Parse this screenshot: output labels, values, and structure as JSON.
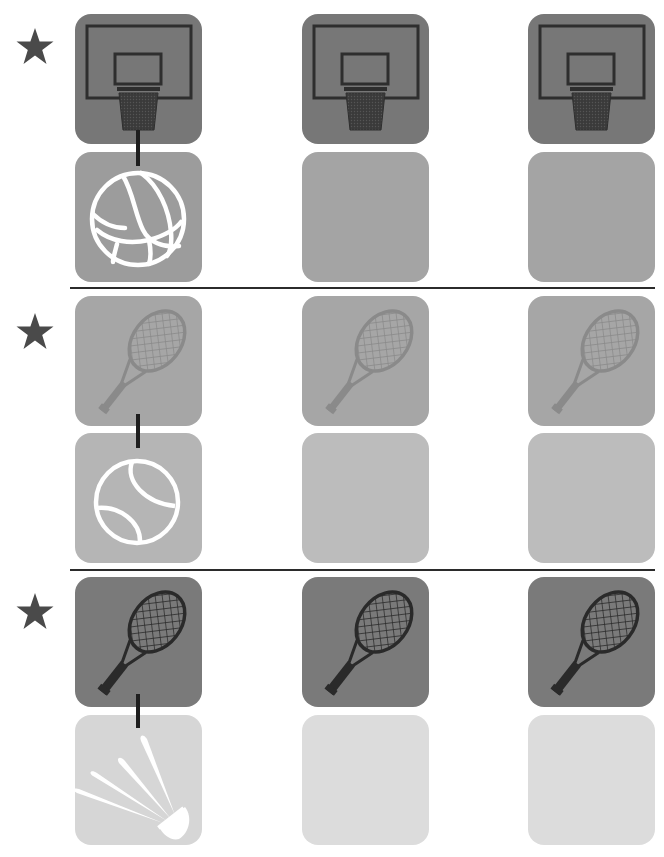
{
  "worksheet": {
    "type": "matching-activity",
    "columns": 3,
    "colors": {
      "star": "#4a4a4a",
      "connector": "#1e1e1e",
      "divider": "#2b2b2b",
      "glyph_white": "#ffffff"
    },
    "sections": [
      {
        "id": "basketball",
        "top": 14,
        "star_top": 27,
        "connector_top": 130,
        "connector_height": 36,
        "top_tile": {
          "icon": "basketball-hoop-icon",
          "bg": "#777777",
          "glyph": "#2e2e2e"
        },
        "bottom_tile": {
          "icon": "basketball-icon",
          "bg": "#9c9c9c"
        },
        "bottom_top": 152,
        "blank_bg": "#a4a4a4",
        "example_pair": [
          "basketball-hoop",
          "basketball"
        ]
      },
      {
        "id": "tennis",
        "top": 296,
        "star_top": 312,
        "connector_top": 414,
        "connector_height": 34,
        "top_tile": {
          "icon": "tennis-racket-icon",
          "bg": "#a6a6a6",
          "glyph": "#8a8a8a"
        },
        "bottom_tile": {
          "icon": "tennis-ball-icon",
          "bg": "#b5b5b5"
        },
        "bottom_top": 433,
        "blank_bg": "#bcbcbc",
        "example_pair": [
          "tennis-racket",
          "tennis-ball"
        ]
      },
      {
        "id": "badminton",
        "top": 577,
        "star_top": 592,
        "connector_top": 694,
        "connector_height": 34,
        "top_tile": {
          "icon": "badminton-racket-icon",
          "bg": "#7a7a7a",
          "glyph": "#2a2a2a"
        },
        "bottom_tile": {
          "icon": "shuttlecock-icon",
          "bg": "#d6d6d6"
        },
        "bottom_top": 715,
        "blank_bg": "#dcdcdc",
        "example_pair": [
          "badminton-racket",
          "shuttlecock"
        ]
      }
    ],
    "column_x": [
      75,
      302,
      528
    ],
    "dividers_y": [
      287,
      569
    ]
  }
}
